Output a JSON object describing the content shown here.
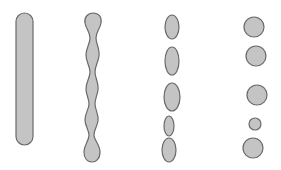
{
  "diagram": {
    "colors": {
      "fill": "#c4c4c4",
      "stroke": "#6a6a6a",
      "background": "#ffffff"
    },
    "stages": [
      {
        "name": "uniform-cylinder",
        "shape": "rounded-rect",
        "x": 16,
        "y": 13,
        "width": 17,
        "height": 132
      },
      {
        "name": "perturbed-column",
        "shape": "wavy-column"
      },
      {
        "name": "elongated-droplets",
        "shape": "ellipses",
        "items": [
          {
            "cx": 172,
            "cy": 27,
            "rx": 7,
            "ry": 12
          },
          {
            "cx": 172,
            "cy": 61,
            "rx": 7,
            "ry": 14
          },
          {
            "cx": 172,
            "cy": 97,
            "rx": 8,
            "ry": 14
          },
          {
            "cx": 169,
            "cy": 126,
            "rx": 5,
            "ry": 10
          },
          {
            "cx": 169,
            "cy": 150,
            "rx": 7,
            "ry": 12
          }
        ]
      },
      {
        "name": "spherical-droplets",
        "shape": "circles",
        "items": [
          {
            "cx": 254,
            "cy": 27,
            "r": 10
          },
          {
            "cx": 256,
            "cy": 56,
            "r": 10
          },
          {
            "cx": 257,
            "cy": 95,
            "r": 10
          },
          {
            "cx": 255,
            "cy": 124,
            "r": 6
          },
          {
            "cx": 253,
            "cy": 148,
            "r": 10
          }
        ]
      }
    ]
  }
}
